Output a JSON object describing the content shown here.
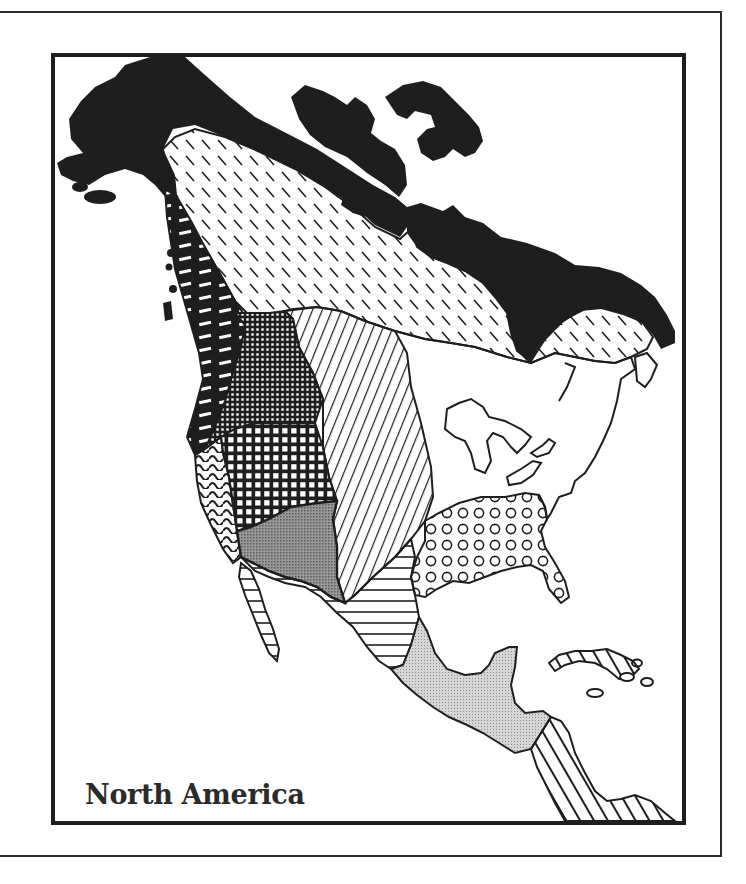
{
  "map": {
    "title": "North America",
    "style": "black-and-white hatched regional map",
    "colors": {
      "ink": "#1e1e1e",
      "paper": "#ffffff",
      "stipple_dark": "#8c8c8c",
      "stipple_light": "#c8c8c8"
    },
    "regions": [
      {
        "id": "arctic",
        "pattern": "solid-black",
        "location": "Arctic coast, Alaska, Greenland-facing islands, Hudson Bay shores"
      },
      {
        "id": "subarctic",
        "pattern": "dashed-diagonal",
        "location": "Alaska interior across Canada to Labrador"
      },
      {
        "id": "northwest-coast",
        "pattern": "black-with-white-bars",
        "location": "Pacific Northwest coast"
      },
      {
        "id": "plateau",
        "pattern": "fine-crosshatch",
        "location": "Columbia Plateau"
      },
      {
        "id": "great-basin",
        "pattern": "grid",
        "location": "Great Basin"
      },
      {
        "id": "california",
        "pattern": "wavy-lines",
        "location": "California coast"
      },
      {
        "id": "plains",
        "pattern": "diagonal-lines",
        "location": "Great Plains"
      },
      {
        "id": "southwest",
        "pattern": "dark-stipple",
        "location": "American Southwest"
      },
      {
        "id": "southeast",
        "pattern": "circles",
        "location": "Southeastern United States"
      },
      {
        "id": "northeast",
        "pattern": "blank",
        "location": "Eastern Woodlands / Great Lakes"
      },
      {
        "id": "northern-mexico",
        "pattern": "horizontal-lines",
        "location": "Northern Mexico and Baja California"
      },
      {
        "id": "mesoamerica",
        "pattern": "light-stipple",
        "location": "Central Mexico to Guatemala"
      },
      {
        "id": "circum-caribbean",
        "pattern": "bold-diagonal-lines",
        "location": "Lower Central America and Caribbean islands"
      }
    ]
  }
}
